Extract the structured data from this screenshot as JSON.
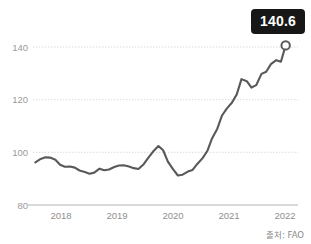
{
  "chart_data": {
    "type": "line",
    "title": "",
    "subtitle": "",
    "xlabel": "",
    "ylabel": "",
    "xlim": [
      2017.75,
      2022.25
    ],
    "ylim": [
      80,
      148
    ],
    "yticks": [
      80,
      100,
      120,
      140
    ],
    "ytick_labels": [
      "80",
      "100",
      "120",
      "140"
    ],
    "xticks": [
      2018,
      2019,
      2020,
      2021,
      2022
    ],
    "xtick_labels": [
      "2018",
      "2019",
      "2020",
      "2021",
      "2022"
    ],
    "grid": "horizontal-dotted",
    "legend": "none",
    "line_color": "#59595b",
    "series": [
      {
        "name": "FAO Food Price Index",
        "x": [
          2017.79,
          2017.88,
          2017.96,
          2018.04,
          2018.13,
          2018.21,
          2018.29,
          2018.38,
          2018.46,
          2018.54,
          2018.63,
          2018.71,
          2018.79,
          2018.88,
          2018.96,
          2019.04,
          2019.13,
          2019.21,
          2019.29,
          2019.38,
          2019.46,
          2019.54,
          2019.63,
          2019.71,
          2019.79,
          2019.88,
          2019.96,
          2020.04,
          2020.13,
          2020.21,
          2020.29,
          2020.38,
          2020.46,
          2020.54,
          2020.63,
          2020.71,
          2020.79,
          2020.88,
          2020.96,
          2021.04,
          2021.13,
          2021.21,
          2021.29,
          2021.38,
          2021.46,
          2021.54,
          2021.63,
          2021.71,
          2021.79,
          2021.88,
          2021.96,
          2022.04
        ],
        "values": [
          96.2,
          97.5,
          98.1,
          98.0,
          97.2,
          95.3,
          94.5,
          94.6,
          94.2,
          93.1,
          92.5,
          91.9,
          92.3,
          93.8,
          93.2,
          93.5,
          94.4,
          95.0,
          95.1,
          94.6,
          94.0,
          93.7,
          95.5,
          98.0,
          100.3,
          102.4,
          100.8,
          96.5,
          93.5,
          91.2,
          91.5,
          92.7,
          93.3,
          95.6,
          97.8,
          100.5,
          105.3,
          109.0,
          114.0,
          116.6,
          118.9,
          122.0,
          127.8,
          127.0,
          124.6,
          125.5,
          129.8,
          130.6,
          133.5,
          135.0,
          134.4,
          140.6
        ]
      }
    ],
    "highlight_point": {
      "x": 2022.04,
      "value": 140.6,
      "label": "140.6",
      "marker": "open-circle"
    },
    "badge_label": "140.6",
    "badge_background": "#171717",
    "badge_text_color": "#ffffff",
    "source_note": "출처: FAO"
  }
}
